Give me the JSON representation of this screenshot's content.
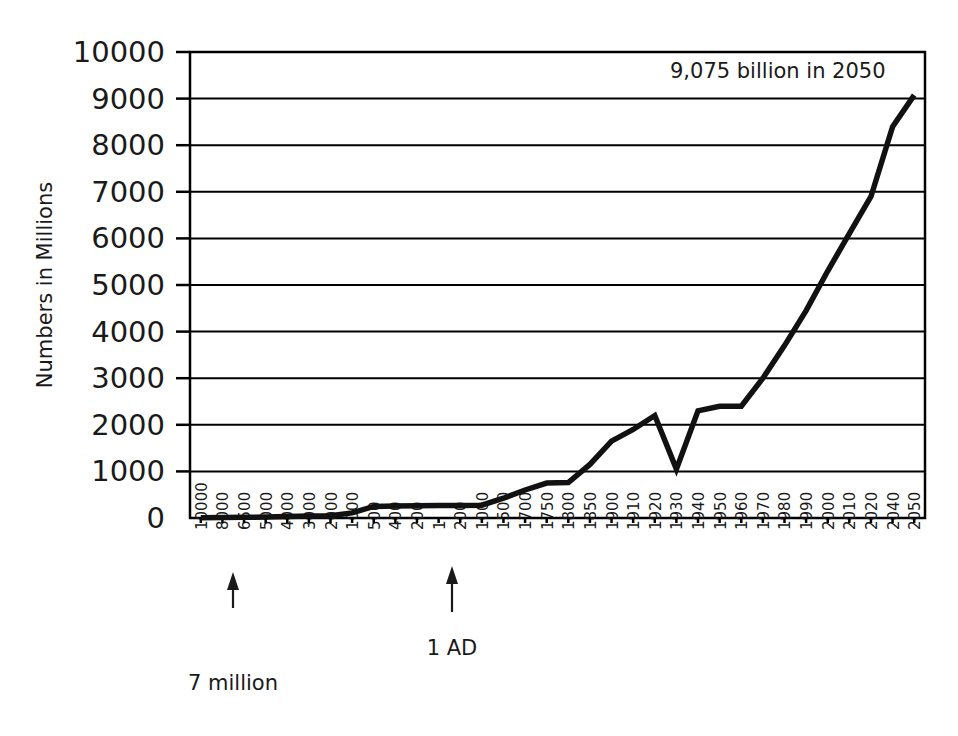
{
  "chart_data": {
    "type": "line",
    "title": "",
    "xlabel": "",
    "ylabel": "Numbers in Millions",
    "ylim": [
      0,
      10000
    ],
    "ytick_values": [
      0,
      1000,
      2000,
      3000,
      4000,
      5000,
      6000,
      7000,
      8000,
      9000,
      10000
    ],
    "ytick_labels": [
      "0",
      "1000",
      "2000",
      "3000",
      "4000",
      "5000",
      "6000",
      "7000",
      "8000",
      "9000",
      "10000"
    ],
    "grid": true,
    "legend": "none",
    "categories": [
      "10000",
      "8000",
      "6500",
      "5000",
      "4000",
      "3000",
      "2000",
      "1000",
      "500",
      "400",
      "200",
      "1",
      "200",
      "1000",
      "1500",
      "1700",
      "1750",
      "1800",
      "1850",
      "1900",
      "1910",
      "1920",
      "1930",
      "1940",
      "1950",
      "1960",
      "1970",
      "1980",
      "1990",
      "2000",
      "2010",
      "2020",
      "2040",
      "2050"
    ],
    "values": [
      7,
      10,
      15,
      20,
      30,
      40,
      50,
      110,
      250,
      260,
      265,
      270,
      270,
      275,
      425,
      600,
      750,
      760,
      1150,
      1650,
      1900,
      2200,
      1050,
      2300,
      2400,
      2400,
      3000,
      3700,
      4450,
      5300,
      6100,
      6900,
      8400,
      9075
    ],
    "annotations": [
      {
        "name": "end-value-callout",
        "text": "9,075 billion in 2050",
        "target_category": "2050",
        "target_value": 9075
      },
      {
        "name": "start-value-callout",
        "text": "7 million",
        "target_category": "10000",
        "target_value": 7
      },
      {
        "name": "epoch-callout",
        "text": "1 AD",
        "target_category": "1",
        "target_value": 270
      }
    ]
  },
  "colors": {
    "line": "#111111",
    "grid": "#000000",
    "axis": "#000000",
    "text": "#1a1a1a",
    "background": "#ffffff"
  }
}
